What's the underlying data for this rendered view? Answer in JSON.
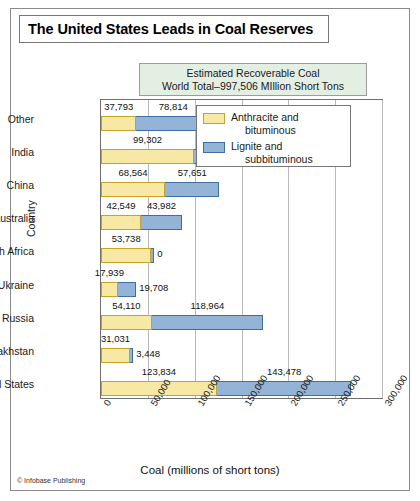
{
  "title": "The United States Leads in Coal Reserves",
  "subtitle": {
    "line1": "Estimated Recoverable Coal",
    "line2": "World Total–997,506 MIllion Short Tons"
  },
  "credit": "© Infobase Publishing",
  "colors": {
    "anthracite_fill": "#F7E8A4",
    "anthracite_border": "#C9A227",
    "lignite_fill": "#93B3D7",
    "lignite_border": "#3D6EA5",
    "subtitle_bg": "#E4EFE4",
    "frame": "#6F6F6F",
    "grid": "#B9B9B9"
  },
  "legend": {
    "position": "inside-top-right",
    "entries": [
      {
        "label_line1": "Anthracite and",
        "label_line2": "bituminous",
        "swatch": "anthracite-swatch"
      },
      {
        "label_line1": "Lignite and",
        "label_line2": "subbituminous",
        "swatch": "lignite-swatch"
      }
    ]
  },
  "chart_data": {
    "type": "bar",
    "orientation": "horizontal",
    "stacked": true,
    "title": "The United States Leads in Coal Reserves",
    "subtitle": "Estimated Recoverable Coal World Total–997,506 MIllion Short Tons",
    "xlabel": "Coal (millions of short tons)",
    "ylabel": "Country",
    "xlim": [
      0,
      300000
    ],
    "xticks": [
      0,
      50000,
      100000,
      150000,
      200000,
      250000,
      300000
    ],
    "xtick_labels": [
      "0",
      "50,000",
      "100,000",
      "150,000",
      "200,000",
      "250,000",
      "300,000"
    ],
    "grid": "vertical",
    "categories": [
      "Other",
      "India",
      "China",
      "Australia",
      "South Africa",
      "Ukraine",
      "Russia",
      "Kazakhstan",
      "United States"
    ],
    "series": [
      {
        "name": "Anthracite and bituminous",
        "values": [
          37793,
          99302,
          68564,
          42549,
          53738,
          17939,
          54110,
          31031,
          123834
        ],
        "labels": [
          "37,793",
          "99,302",
          "68,564",
          "42,549",
          "53,738",
          "17,939",
          "54,110",
          "31,031",
          "123,834"
        ]
      },
      {
        "name": "Lignite and subbituminous",
        "values": [
          78814,
          2600,
          57651,
          43982,
          0,
          19708,
          118964,
          3448,
          143478
        ],
        "labels": [
          "78,814",
          "2,600",
          "57,651",
          "43,982",
          "0",
          "19,708",
          "118,964",
          "3,448",
          "143,478"
        ]
      }
    ],
    "totals": [
      116607,
      101902,
      126215,
      86531,
      53738,
      37647,
      173074,
      34479,
      267312
    ]
  }
}
